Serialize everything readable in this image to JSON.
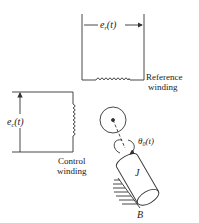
{
  "diagram": {
    "reference": {
      "voltage_label": "e",
      "voltage_sub": "r",
      "voltage_arg": "(t)",
      "caption_line1": "Reference",
      "caption_line2": "winding"
    },
    "control": {
      "voltage_label": "e",
      "voltage_sub": "c",
      "voltage_arg": "(t)",
      "caption_line1": "Control",
      "caption_line2": "winding"
    },
    "rotor": {
      "angle_label": "θ",
      "angle_sub": "0",
      "angle_arg": "(t)",
      "inertia_label": "J",
      "friction_label": "B"
    },
    "colors": {
      "line": "#333333",
      "background": "#ffffff"
    }
  }
}
